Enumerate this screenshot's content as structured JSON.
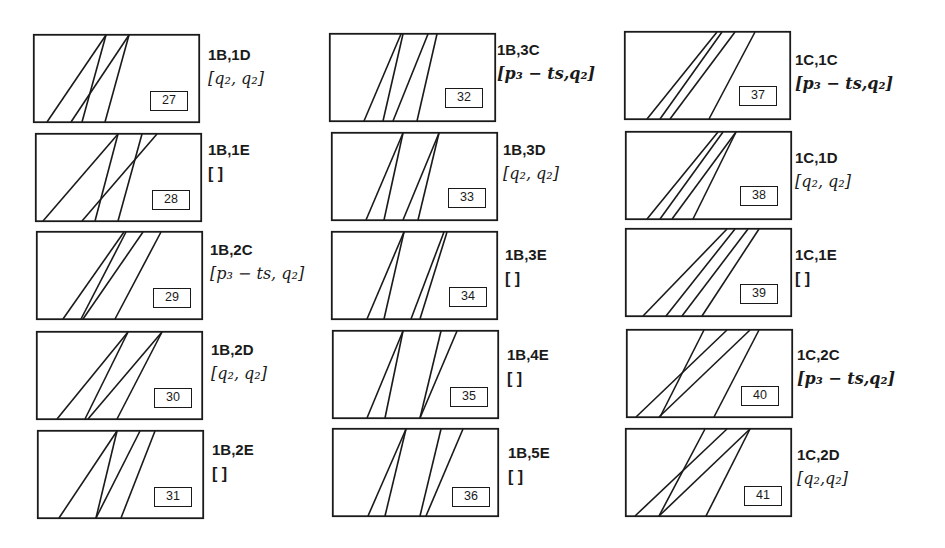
{
  "figure": {
    "panels": [
      {
        "number": "27",
        "case": "1B,1D",
        "interval": "[q₂, q₂]",
        "interval_style": "italic",
        "box": [
          33,
          34
        ],
        "num_pos": [
          117,
          57
        ],
        "label_pos": [
          208,
          45
        ],
        "lines": [
          [
            73,
            14
          ],
          [
            73,
            49
          ],
          [
            96,
            38
          ],
          [
            96,
            72
          ]
        ]
      },
      {
        "number": "28",
        "case": "1B,1E",
        "interval": "[ ]",
        "interval_style": "plain",
        "box": [
          35,
          133
        ],
        "num_pos": [
          117,
          57
        ],
        "label_pos": [
          208,
          140
        ],
        "lines": [
          [
            83,
            8
          ],
          [
            83,
            60
          ],
          [
            107,
            83
          ],
          [
            122,
            47
          ]
        ]
      },
      {
        "number": "29",
        "case": "1B,2C",
        "interval": "[p₃ − ts, q₂]",
        "interval_style": "italic",
        "box": [
          36,
          231
        ],
        "num_pos": [
          117,
          57
        ],
        "label_pos": [
          210,
          240
        ],
        "lines": [
          [
            88,
            27
          ],
          [
            90,
            45
          ],
          [
            107,
            47
          ],
          [
            125,
            79
          ]
        ]
      },
      {
        "number": "30",
        "case": "1B,2D",
        "interval": "[q₂, q₂]",
        "interval_style": "italic",
        "box": [
          36,
          331
        ],
        "num_pos": [
          118,
          57
        ],
        "label_pos": [
          211,
          340
        ],
        "lines": [
          [
            92,
            21
          ],
          [
            92,
            49
          ],
          [
            126,
            52
          ],
          [
            126,
            81
          ]
        ]
      },
      {
        "number": "31",
        "case": "1B,2E",
        "interval": "[ ]",
        "interval_style": "plain",
        "box": [
          37,
          430
        ],
        "num_pos": [
          117,
          57
        ],
        "label_pos": [
          212,
          440
        ],
        "lines": [
          [
            80,
            22
          ],
          [
            80,
            59
          ],
          [
            103,
            59
          ],
          [
            118,
            84
          ]
        ]
      },
      {
        "number": "32",
        "case": "1B,3C",
        "interval": "[p₃ − ts,q₂]",
        "interval_style": "bold",
        "box": [
          329,
          33
        ],
        "num_pos": [
          116,
          55
        ],
        "label_pos": [
          497,
          40
        ],
        "lines": [
          [
            72,
            35
          ],
          [
            74,
            54
          ],
          [
            99,
            64
          ],
          [
            108,
            88
          ]
        ]
      },
      {
        "number": "33",
        "case": "1B,3D",
        "interval": "[q₂, q₂]",
        "interval_style": "italic",
        "box": [
          331,
          132
        ],
        "num_pos": [
          117,
          56
        ],
        "label_pos": [
          503,
          140
        ],
        "lines": [
          [
            72,
            35
          ],
          [
            72,
            53
          ],
          [
            108,
            72
          ],
          [
            108,
            87
          ]
        ]
      },
      {
        "number": "34",
        "case": "1B,3E",
        "interval": "[ ]",
        "interval_style": "plain",
        "box": [
          331,
          231
        ],
        "num_pos": [
          118,
          56
        ],
        "label_pos": [
          505,
          245
        ],
        "lines": [
          [
            73,
            36
          ],
          [
            73,
            53
          ],
          [
            113,
            80
          ],
          [
            116,
            89
          ]
        ]
      },
      {
        "number": "35",
        "case": "1B,4E",
        "interval": "[ ]",
        "interval_style": "plain",
        "box": [
          332,
          330
        ],
        "num_pos": [
          118,
          57
        ],
        "label_pos": [
          507,
          345
        ],
        "lines": [
          [
            71,
            35
          ],
          [
            71,
            53
          ],
          [
            109,
            88
          ],
          [
            125,
            88
          ]
        ]
      },
      {
        "number": "36",
        "case": "1B,5E",
        "interval": "[ ]",
        "interval_style": "plain",
        "box": [
          332,
          428
        ],
        "num_pos": [
          120,
          59
        ],
        "label_pos": [
          508,
          443
        ],
        "lines": [
          [
            74,
            36
          ],
          [
            74,
            53
          ],
          [
            109,
            88
          ],
          [
            131,
            94
          ]
        ]
      },
      {
        "number": "37",
        "case": "1C,1C",
        "interval": "[p₃ − ts,q₂]",
        "interval_style": "bold",
        "box": [
          624,
          31
        ],
        "num_pos": [
          115,
          55
        ],
        "label_pos": [
          795,
          50
        ],
        "lines": [
          [
            93,
            23
          ],
          [
            98,
            36
          ],
          [
            111,
            46
          ],
          [
            131,
            85
          ]
        ]
      },
      {
        "number": "38",
        "case": "1C,1D",
        "interval": "[q₂, q₂]",
        "interval_style": "italic",
        "box": [
          625,
          131
        ],
        "num_pos": [
          115,
          55
        ],
        "label_pos": [
          795,
          148
        ],
        "lines": [
          [
            93,
            22
          ],
          [
            98,
            35
          ],
          [
            111,
            47
          ],
          [
            111,
            68
          ]
        ]
      },
      {
        "number": "39",
        "case": "1C,1E",
        "interval": "[ ]",
        "interval_style": "plain",
        "box": [
          625,
          228
        ],
        "num_pos": [
          115,
          56
        ],
        "label_pos": [
          795,
          245
        ],
        "lines": [
          [
            102,
            18
          ],
          [
            110,
            41
          ],
          [
            123,
            57
          ],
          [
            134,
            77
          ]
        ]
      },
      {
        "number": "40",
        "case": "1C,2C",
        "interval": "[p₃ − ts,q₂]",
        "interval_style": "bold",
        "box": [
          626,
          329
        ],
        "num_pos": [
          115,
          57
        ],
        "label_pos": [
          797,
          345
        ],
        "lines": [
          [
            78,
            34
          ],
          [
            101,
            10
          ],
          [
            124,
            33
          ],
          [
            133,
            88
          ]
        ]
      },
      {
        "number": "41",
        "case": "1C,2D",
        "interval": "[q₂,q₂]",
        "interval_style": "italic",
        "box": [
          625,
          428
        ],
        "num_pos": [
          119,
          58
        ],
        "label_pos": [
          797,
          445
        ],
        "lines": [
          [
            80,
            34
          ],
          [
            102,
            10
          ],
          [
            125,
            34
          ],
          [
            125,
            81
          ]
        ]
      }
    ]
  },
  "colors": {
    "stroke": "#1a1a1a",
    "background": "#ffffff"
  }
}
